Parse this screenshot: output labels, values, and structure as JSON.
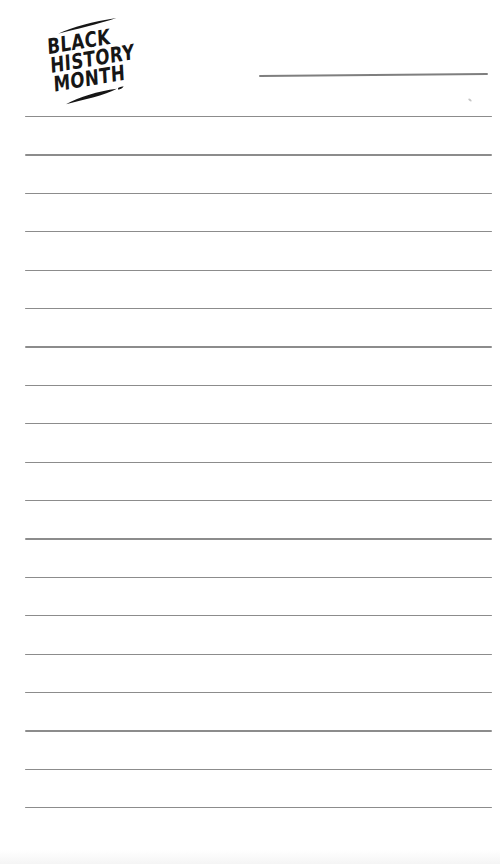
{
  "page": {
    "background_color": "#ffffff"
  },
  "logo": {
    "words": [
      "BLACK",
      "HISTORY",
      "MONTH"
    ],
    "color": "#161616",
    "rotation_deg": -9.5,
    "decorations": [
      "brush-stroke-top",
      "brush-stroke-bottom"
    ]
  },
  "name_line": {
    "value": "",
    "color": "#7f7f7f"
  },
  "writing_lines": {
    "count": 19,
    "color": "#8c8c8c",
    "first_y_px": 116,
    "spacing_px": 38.4,
    "left_px": 25,
    "width_px": 467
  }
}
